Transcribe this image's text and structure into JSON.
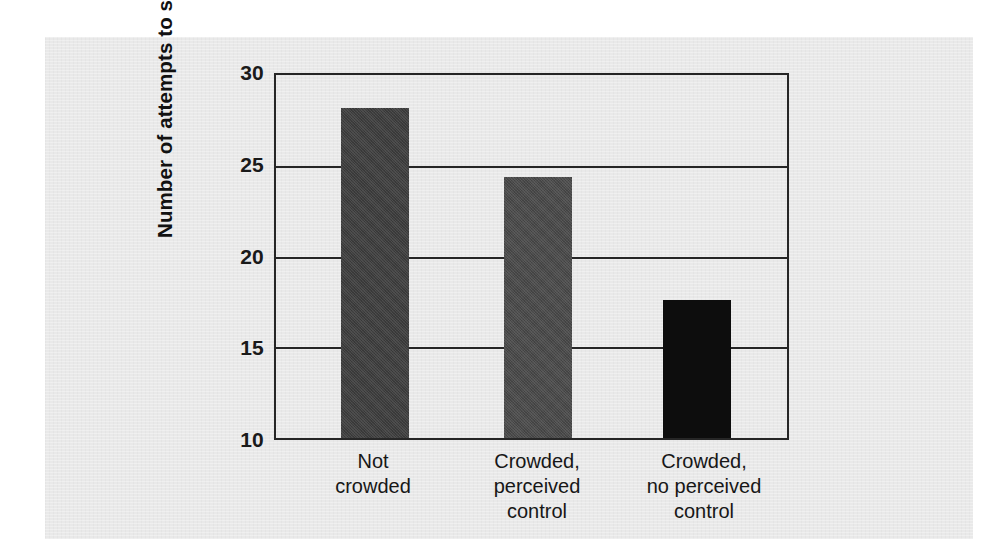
{
  "chart_data": {
    "type": "bar",
    "title": "",
    "xlabel": "",
    "ylabel": "Number of attempts to solve puzzles",
    "categories": [
      "Not\ncrowded",
      "Crowded,\nperceived\ncontrol",
      "Crowded,\nno perceived\ncontrol"
    ],
    "values": [
      28.0,
      24.2,
      17.5
    ],
    "ylim": [
      10,
      30
    ],
    "yticks": [
      10,
      15,
      20,
      25,
      30
    ],
    "ytick_labels": [
      "10",
      "15",
      "20",
      "25",
      "30"
    ],
    "grid": "horizontal",
    "legend": "none",
    "bar_colors": [
      "#3e3e3e",
      "#4a4a4a",
      "#0d0d0d"
    ],
    "series": [
      {
        "name": "Number of attempts to solve puzzles",
        "values": [
          28.0,
          24.2,
          17.5
        ]
      }
    ]
  },
  "figure": {
    "panel_color": "#e9e9e9",
    "axis_color": "#262626",
    "background": "#ffffff"
  }
}
